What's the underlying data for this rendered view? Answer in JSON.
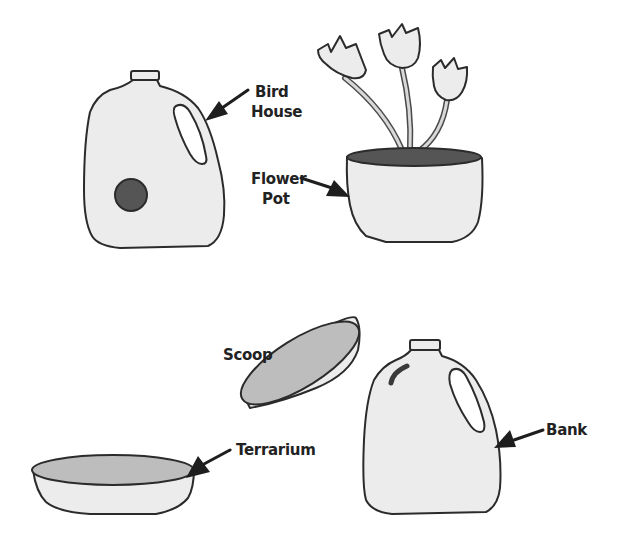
{
  "colors": {
    "outline": "#2b2b2b",
    "jug_fill": "#ececec",
    "dark_fill": "#555555",
    "inner_fill": "#bdbdbd",
    "background": "#ffffff"
  },
  "items": [
    {
      "id": "bird-house",
      "label_lines": [
        "Bird",
        "House"
      ]
    },
    {
      "id": "flower-pot",
      "label_lines": [
        "Flower",
        "Pot"
      ]
    },
    {
      "id": "scoop",
      "label_lines": [
        "Scoop"
      ]
    },
    {
      "id": "terrarium",
      "label_lines": [
        "Terrarium"
      ]
    },
    {
      "id": "bank",
      "label_lines": [
        "Bank"
      ]
    }
  ]
}
